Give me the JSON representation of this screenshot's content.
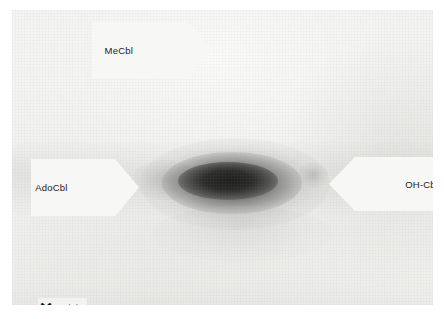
{
  "figure": {
    "kind": "tlc-plate-autoradiograph",
    "plate_background_color": "#eeeeec",
    "page_background_color": "#ffffff"
  },
  "labels": {
    "mecbl": {
      "text": "MeCbl",
      "direction": "right",
      "icon": "arrow-right-flag"
    },
    "adocbl": {
      "text": "AdoCbl",
      "direction": "right",
      "icon": "arrow-right-flag"
    },
    "ohcbl": {
      "text": "OH-Cbl",
      "direction": "left",
      "icon": "arrow-left-flag"
    }
  },
  "origin": {
    "marker": "✕",
    "marker_icon": "cross-marker-icon",
    "text": "origin"
  },
  "spots": [
    {
      "name": "main-spot",
      "associated_label": "AdoCbl",
      "center_x": 216,
      "center_y": 171,
      "intensity": "dark",
      "shape": "horizontal-ellipse"
    },
    {
      "name": "faint-spot",
      "associated_label": "OH-Cbl",
      "center_x": 301,
      "center_y": 165,
      "intensity": "very-faint",
      "shape": "small-blur"
    }
  ]
}
